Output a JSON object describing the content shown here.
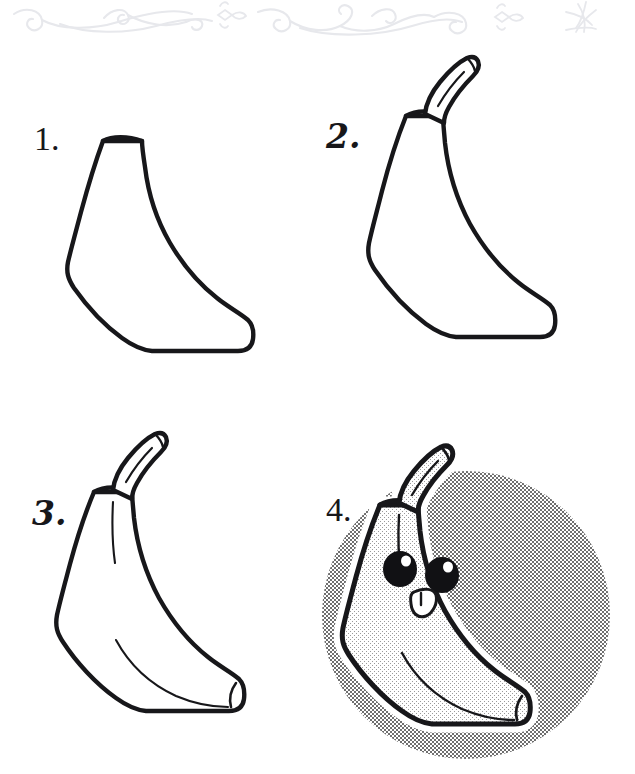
{
  "page": {
    "background_color": "#ffffff",
    "ink_color": "#17171a",
    "width": 635,
    "height": 774
  },
  "header": {
    "ornament_name": "scrollwork-flourish-divider",
    "ornament_color": "#e7e8ec",
    "motif_count": 2,
    "accent_stars": 3
  },
  "steps": [
    {
      "id": "step-1",
      "number_label": "1.",
      "number_style": "plain",
      "caption": "Draw the curved banana body outline",
      "elements": [
        "body-outline"
      ],
      "has_stem": false,
      "has_interior_lines": false,
      "has_face": false,
      "has_background_circle": false
    },
    {
      "id": "step-2",
      "number_label": "2.",
      "number_style": "fancy",
      "caption": "Add the stem at the top",
      "elements": [
        "body-outline",
        "stem"
      ],
      "has_stem": true,
      "has_interior_lines": false,
      "has_face": false,
      "has_background_circle": false
    },
    {
      "id": "step-3",
      "number_label": "3.",
      "number_style": "fancy",
      "caption": "Add inner peel ridge lines and the blunt tip",
      "elements": [
        "body-outline",
        "stem",
        "ridge-lines",
        "tip-detail"
      ],
      "has_stem": true,
      "has_interior_lines": true,
      "has_face": false,
      "has_background_circle": false
    },
    {
      "id": "step-4",
      "number_label": "4.",
      "number_style": "plain",
      "caption": "Add the kawaii face and shade the background",
      "elements": [
        "background-circle",
        "white-halo",
        "body-outline",
        "stem",
        "ridge-lines",
        "tip-detail",
        "eyes",
        "mouth"
      ],
      "has_stem": true,
      "has_interior_lines": true,
      "has_face": true,
      "has_background_circle": true
    }
  ],
  "face": {
    "eye_count": 2,
    "eye_color": "#111114",
    "eye_highlight_color": "#ffffff",
    "mouth_name": "open-smiling-mouth",
    "mouth_fill": "#ffffff",
    "expression": "happy"
  },
  "colors": {
    "outline": "#17171a",
    "halftone_gray": "#9d9d9d",
    "peel_fill": "#efefef",
    "halo_white": "#ffffff",
    "ornament": "#e7e8ec"
  }
}
